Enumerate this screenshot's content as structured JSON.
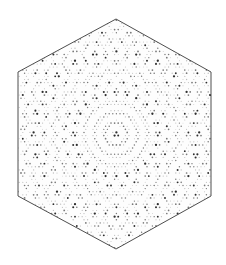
{
  "figure": {
    "width": 226,
    "height": 265,
    "background": "#ffffff",
    "hexagon": {
      "vertices": [
        [
          116,
          19
        ],
        [
          211,
          72
        ],
        [
          211,
          196
        ],
        [
          116,
          249
        ],
        [
          18,
          196
        ],
        [
          18,
          72
        ]
      ],
      "stroke": "#3a3a3a",
      "stroke_width": 0.9,
      "fill": "#fdfdfd"
    },
    "pattern": {
      "symmetry": 12,
      "spacing": 3.6,
      "wave_scale": 0.62,
      "dark_color": "#2e2e2e",
      "mid_color": "#7a7a7a",
      "light_color": "#bdbdbd",
      "dot_min_radius": 0.45,
      "dot_max_radius": 1.15
    }
  }
}
